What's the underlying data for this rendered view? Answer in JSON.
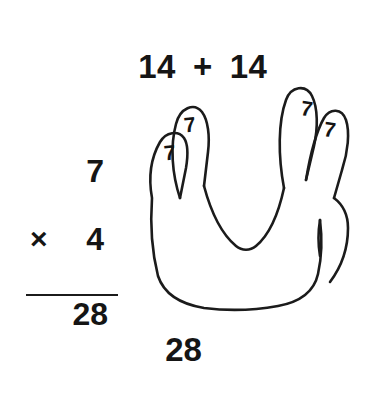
{
  "canvas": {
    "width": 367,
    "height": 393,
    "background_color": "#ffffff",
    "ink_color": "#151515"
  },
  "top_equation": {
    "left_addend": "14",
    "operator": "+",
    "right_addend": "14"
  },
  "multiplication": {
    "multiplicand": "7",
    "operator": "×",
    "multiplier": "4",
    "product": "28"
  },
  "hand": {
    "description": "outline drawing of a hand with four raised fingers and a tucked thumb",
    "finger_labels": [
      {
        "finger": "pinky",
        "value": "7"
      },
      {
        "finger": "ring",
        "value": "7"
      },
      {
        "finger": "middle",
        "value": "7"
      },
      {
        "finger": "index",
        "value": "7"
      }
    ]
  },
  "bottom_answer": "28"
}
